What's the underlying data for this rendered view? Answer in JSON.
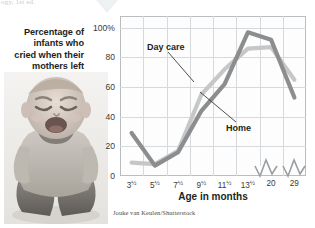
{
  "figure": {
    "top_fragment": "ogy, 1st ed.",
    "title_lines": [
      "Percentage of",
      "infants who",
      "cried when their",
      "mothers left"
    ],
    "credit": "Jouke van Keulen/Shutterstock",
    "photo_alt": "crying-infant-photo"
  },
  "colors": {
    "day_care_line": "#c6c7c8",
    "home_line": "#8c8d8f",
    "grid": "#d7dadd",
    "frame": "#b9bdc0",
    "text": "#231f20"
  },
  "chart_data": {
    "type": "line",
    "title": "Percentage of infants who cried when their mothers left",
    "xlabel": "Age in months",
    "ylabel": "",
    "categories": [
      "3½",
      "5½",
      "7½",
      "9½",
      "11½",
      "13½",
      "20",
      "29"
    ],
    "x_tick_labels": [
      "3",
      "5",
      "7",
      "9",
      "11",
      "13",
      "20",
      "29"
    ],
    "x_tick_fractions": [
      "½",
      "½",
      "½",
      "½",
      "½",
      "½",
      "",
      ""
    ],
    "y_tick_labels": [
      "100%",
      "80",
      "60",
      "40",
      "20",
      "0"
    ],
    "y_ticks": [
      100,
      80,
      60,
      40,
      20,
      0
    ],
    "ylim": [
      0,
      108
    ],
    "grid": true,
    "axis_breaks": 2,
    "legend_position": "inline-annotations",
    "series": [
      {
        "name": "Day care",
        "color": "#c6c7c8",
        "values": [
          9,
          8,
          17,
          55,
          72,
          86,
          87,
          65
        ]
      },
      {
        "name": "Home",
        "color": "#8c8d8f",
        "values": [
          29,
          7,
          16,
          44,
          62,
          97,
          92,
          53
        ]
      }
    ],
    "annotations": [
      {
        "text": "Day care",
        "points_to_series": "Day care"
      },
      {
        "text": "Home",
        "points_to_series": "Home"
      }
    ]
  }
}
